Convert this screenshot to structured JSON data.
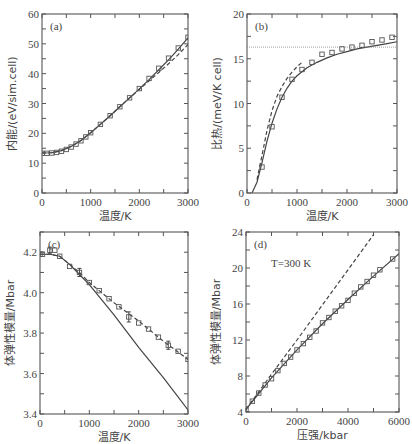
{
  "chart_data": [
    {
      "id": "a",
      "panel_label": "(a)",
      "type": "line",
      "xlabel": "温度/K",
      "ylabel": "内能/(eV/sim.cell)",
      "xlim": [
        0,
        3000
      ],
      "ylim": [
        0,
        60
      ],
      "xticks": [
        0,
        1000,
        2000,
        3000
      ],
      "yticks": [
        0,
        10,
        20,
        30,
        40,
        50,
        60
      ],
      "frame": {
        "left": 42,
        "top": 14,
        "right": 188,
        "bottom": 193
      },
      "series": [
        {
          "name": "solid",
          "style": "solid",
          "x": [
            0,
            200,
            400,
            600,
            800,
            1000,
            1200,
            1400,
            1600,
            1800,
            2000,
            2200,
            2400,
            2600,
            2800,
            3000
          ],
          "y": [
            13.4,
            13.5,
            14.2,
            15.6,
            17.6,
            20.2,
            23.0,
            25.9,
            28.9,
            31.9,
            34.9,
            38.0,
            41.3,
            44.6,
            48.2,
            52.0
          ]
        },
        {
          "name": "dashed",
          "style": "dashed",
          "x": [
            0,
            200,
            400,
            600,
            800,
            1000,
            1200,
            1400,
            1600,
            1800,
            2000,
            2200,
            2400,
            2600,
            2800,
            3000
          ],
          "y": [
            13.4,
            13.5,
            14.2,
            15.6,
            17.6,
            20.2,
            23.0,
            25.9,
            28.9,
            31.9,
            34.7,
            37.6,
            40.4,
            43.3,
            46.4,
            49.8
          ]
        },
        {
          "name": "squares",
          "style": "marker-square",
          "x": [
            0,
            100,
            200,
            300,
            400,
            500,
            600,
            700,
            800,
            900,
            1000,
            1200,
            1400,
            1600,
            1800,
            2000,
            2200,
            2400,
            2600,
            2800,
            3000
          ],
          "y": [
            13.3,
            13.3,
            13.4,
            13.6,
            14.0,
            14.6,
            15.4,
            16.4,
            17.5,
            18.8,
            20.2,
            23.0,
            25.9,
            28.9,
            31.9,
            35.0,
            38.4,
            41.8,
            45.2,
            48.6,
            52.2
          ]
        }
      ]
    },
    {
      "id": "b",
      "panel_label": "(b)",
      "type": "line",
      "xlabel": "温度/K",
      "ylabel": "比热/(meV/K cell)",
      "xlim": [
        0,
        3000
      ],
      "ylim": [
        0,
        20
      ],
      "xticks": [
        0,
        1000,
        2000,
        3000
      ],
      "yticks": [
        0,
        5,
        10,
        15,
        20
      ],
      "frame": {
        "left": 247,
        "top": 14,
        "right": 397,
        "bottom": 193
      },
      "series": [
        {
          "name": "solid",
          "style": "solid",
          "x": [
            100,
            200,
            300,
            400,
            500,
            600,
            700,
            800,
            900,
            1000,
            1200,
            1400,
            1600,
            1800,
            2000,
            2200,
            2400,
            2600,
            2800,
            3000
          ],
          "y": [
            0,
            1.2,
            3.4,
            5.8,
            7.8,
            9.4,
            10.7,
            11.7,
            12.5,
            13.1,
            14.0,
            14.6,
            15.1,
            15.5,
            15.8,
            16.1,
            16.3,
            16.5,
            16.7,
            16.9
          ]
        },
        {
          "name": "dashed",
          "style": "dashed",
          "x": [
            200,
            300,
            400,
            500,
            600,
            700,
            800,
            900,
            1000,
            1100
          ],
          "y": [
            1.5,
            4.2,
            7.0,
            9.2,
            10.8,
            11.9,
            12.8,
            13.5,
            14.1,
            14.6
          ]
        },
        {
          "name": "classical limit",
          "style": "dotted-horizontal",
          "x": [
            0,
            3000
          ],
          "y": [
            16.3,
            16.3
          ]
        },
        {
          "name": "squares",
          "style": "marker-square",
          "x": [
            300,
            500,
            700,
            900,
            1100,
            1300,
            1500,
            1700,
            1900,
            2100,
            2300,
            2500,
            2700,
            2900
          ],
          "y": [
            2.9,
            7.4,
            10.7,
            12.7,
            13.8,
            14.6,
            15.5,
            15.7,
            16.1,
            16.3,
            16.5,
            16.9,
            17.1,
            17.4
          ]
        }
      ]
    },
    {
      "id": "c",
      "panel_label": "(c)",
      "type": "line",
      "xlabel": "温度/K",
      "ylabel": "体弹性模量/Mbar",
      "xlim": [
        0,
        3000
      ],
      "ylim": [
        3.4,
        4.3
      ],
      "xticks": [
        0,
        1000,
        2000,
        3000
      ],
      "yticks": [
        3.4,
        3.6,
        3.8,
        4.0,
        4.2
      ],
      "ytick_labels": [
        "3.4",
        "3.6",
        "3.8",
        "4.0",
        "4.2"
      ],
      "frame": {
        "left": 40,
        "top": 232,
        "right": 188,
        "bottom": 414
      },
      "series": [
        {
          "name": "solid",
          "style": "solid",
          "x": [
            0,
            200,
            400,
            600,
            800,
            1000,
            1500,
            2000,
            2500,
            3000
          ],
          "y": [
            4.19,
            4.19,
            4.18,
            4.14,
            4.09,
            4.04,
            3.89,
            3.73,
            3.58,
            3.42
          ]
        },
        {
          "name": "dashed",
          "style": "dashed",
          "x": [
            0,
            200,
            400,
            600,
            800,
            1000,
            1500,
            2000,
            2500,
            3000
          ],
          "y": [
            4.19,
            4.19,
            4.18,
            4.14,
            4.1,
            4.05,
            3.95,
            3.86,
            3.76,
            3.67
          ]
        },
        {
          "name": "squares",
          "style": "marker-square-errorbar",
          "x": [
            0,
            50,
            200,
            300,
            400,
            600,
            800,
            1000,
            1200,
            1400,
            1600,
            1800,
            2000,
            2200,
            2400,
            2600,
            2800,
            3000
          ],
          "y": [
            4.19,
            4.19,
            4.21,
            4.21,
            4.18,
            4.13,
            4.1,
            4.05,
            4.01,
            3.97,
            3.93,
            3.88,
            3.85,
            3.82,
            3.78,
            3.74,
            3.71,
            3.67
          ],
          "errors": [
            0,
            0,
            0.015,
            0,
            0,
            0,
            0.02,
            0,
            0,
            0,
            0,
            0.025,
            0,
            0,
            0,
            0.02,
            0,
            0
          ]
        }
      ]
    },
    {
      "id": "d",
      "panel_label": "(d)",
      "type": "line",
      "annotation": "T=300 K",
      "xlabel": "压强/kbar",
      "ylabel": "体弹性模量/Mbar",
      "xlim": [
        0,
        6000
      ],
      "ylim": [
        4,
        24
      ],
      "xticks": [
        0,
        2000,
        4000,
        6000
      ],
      "yticks": [
        4,
        8,
        12,
        16,
        20,
        24
      ],
      "frame": {
        "left": 246,
        "top": 232,
        "right": 399,
        "bottom": 412
      },
      "series": [
        {
          "name": "solid",
          "style": "solid",
          "x": [
            0,
            1000,
            2000,
            3000,
            4000,
            5000,
            6000
          ],
          "y": [
            4.3,
            7.8,
            10.9,
            13.8,
            16.5,
            19.1,
            21.6
          ]
        },
        {
          "name": "dashed",
          "style": "dashed",
          "x": [
            0,
            1000,
            2000,
            3000,
            4000,
            5000
          ],
          "y": [
            4.3,
            8.2,
            12.0,
            15.9,
            19.8,
            23.7
          ]
        },
        {
          "name": "squares",
          "style": "marker-square",
          "x": [
            0,
            250,
            500,
            750,
            1000,
            1250,
            1500,
            1750,
            2000,
            2250,
            2500,
            2750,
            3000,
            3250,
            3500,
            3750,
            4000,
            4250,
            4500,
            4750,
            5000,
            5250,
            5750
          ],
          "y": [
            4.3,
            5.2,
            6.1,
            7.0,
            7.7,
            8.6,
            9.4,
            10.1,
            10.9,
            11.6,
            12.3,
            13.0,
            13.9,
            14.5,
            15.2,
            15.8,
            16.4,
            17.2,
            17.9,
            18.5,
            19.2,
            19.8,
            21.0
          ]
        }
      ]
    }
  ]
}
